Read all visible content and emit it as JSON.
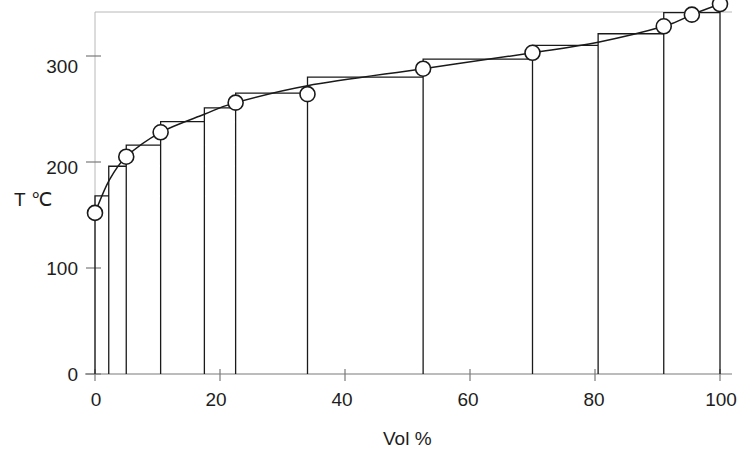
{
  "chart_data": {
    "type": "line",
    "title": "",
    "xlabel": "Vol %",
    "ylabel": "T ℃",
    "xlim": [
      0,
      100
    ],
    "ylim": [
      0,
      355
    ],
    "xticks": [
      0,
      20,
      40,
      60,
      80,
      100
    ],
    "yticks": [
      0,
      100,
      200,
      300
    ],
    "grid": false,
    "legend": null,
    "series": [
      {
        "name": "TBP curve",
        "marker": "circle-open",
        "x": [
          0,
          2.2,
          5.0,
          10.5,
          17.5,
          22.5,
          34.0,
          52.5,
          70.0,
          80.5,
          91.0,
          95.5,
          100.0
        ],
        "y": [
          152,
          182,
          205,
          228,
          245,
          256,
          272,
          288,
          303,
          313,
          328,
          339,
          349
        ]
      }
    ],
    "markers": {
      "name": "Cut mid-point markers",
      "x": [
        0,
        5.0,
        10.5,
        22.5,
        34.0,
        52.5,
        70.0,
        91.0,
        95.5,
        100.0
      ],
      "y": [
        152,
        205,
        228,
        256,
        264,
        288,
        303,
        328,
        339,
        349
      ]
    },
    "bars": {
      "name": "Distillation cuts (step histogram)",
      "edges": [
        0,
        2.2,
        5.0,
        10.5,
        17.5,
        22.5,
        34.0,
        52.5,
        70.0,
        80.5,
        91.0,
        100.0
      ],
      "values": [
        168,
        196,
        216,
        238,
        251,
        265,
        280,
        297,
        310,
        321,
        341
      ]
    }
  },
  "axes": {
    "x_tick_labels": [
      "0",
      "20",
      "40",
      "60",
      "80",
      "100"
    ],
    "y_tick_labels": [
      "0",
      "100",
      "200",
      "300"
    ],
    "x_axis_title": "Vol %",
    "y_axis_title": "T ℃"
  },
  "style": {
    "line_color": "#1a1a1a",
    "bar_color": "#1a1a1a",
    "frame_color": "#b8b8b8",
    "axis_color": "#7a7a7a",
    "background": "#ffffff"
  }
}
